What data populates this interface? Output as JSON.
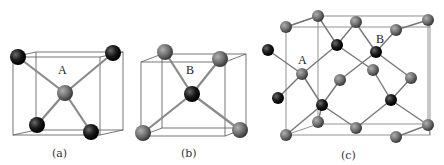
{
  "figure": {
    "panels": [
      {
        "id": "a",
        "caption": "(a)",
        "site_label": "A",
        "description": "Tetrahedral unit: gray central atom A bonded to four dark corner atoms inside a cube"
      },
      {
        "id": "b",
        "caption": "(b)",
        "site_label": "B",
        "description": "Tetrahedral unit: dark central atom B bonded to four gray corner atoms inside a cube"
      },
      {
        "id": "c",
        "caption": "(c)",
        "site_labels": [
          "A",
          "B"
        ],
        "description": "Zinc-blende / diamond-type unit cell with gray and dark atoms"
      }
    ],
    "colors": {
      "dark_atom": "#1a1a1a",
      "gray_atom": "#6e6e6e",
      "bond": "#8a8a8a",
      "cube_edge": "#555555"
    }
  }
}
